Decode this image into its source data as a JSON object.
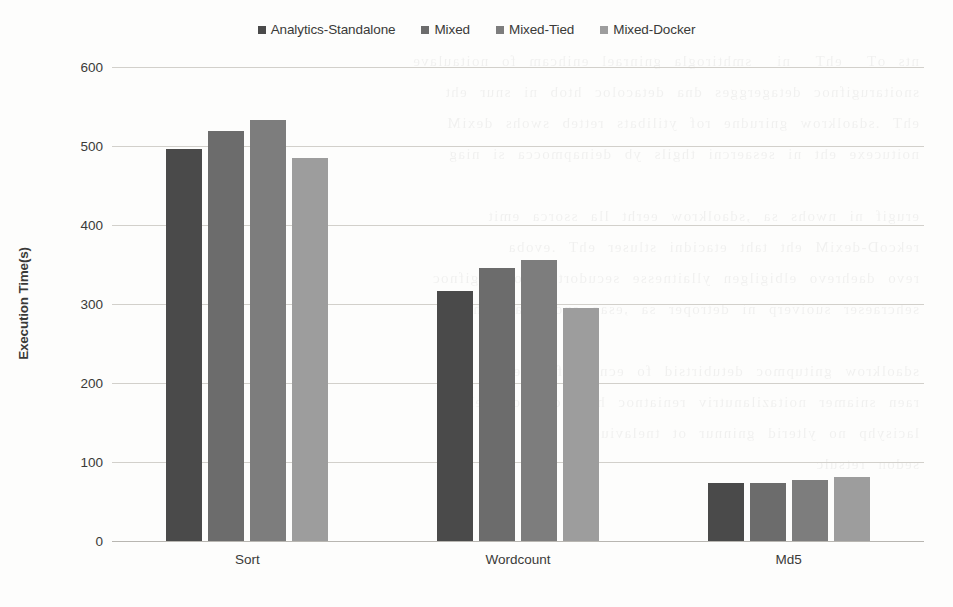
{
  "chart_data": {
    "type": "bar",
    "title": "",
    "xlabel": "",
    "ylabel": "Execution Time(s)",
    "ylim": [
      0,
      600
    ],
    "yticks": [
      0,
      100,
      200,
      300,
      400,
      500,
      600
    ],
    "grid": true,
    "legend_position": "top-center",
    "categories": [
      "Sort",
      "Wordcount",
      "Md5"
    ],
    "series": [
      {
        "name": "Analytics-Standalone",
        "color": "#4a4a4a",
        "values": [
          496,
          316,
          73
        ]
      },
      {
        "name": "Mixed",
        "color": "#6c6c6c",
        "values": [
          519,
          345,
          74
        ]
      },
      {
        "name": "Mixed-Tied",
        "color": "#7d7d7d",
        "values": [
          533,
          356,
          77
        ]
      },
      {
        "name": "Mixed-Docker",
        "color": "#9d9d9d",
        "values": [
          485,
          295,
          81
        ]
      }
    ]
  },
  "axis": {
    "y_title": "Execution Time(s)",
    "y_tick_0": "0",
    "y_tick_1": "100",
    "y_tick_2": "200",
    "y_tick_3": "300",
    "y_tick_4": "400",
    "y_tick_5": "500",
    "y_tick_6": "600"
  },
  "legend": {
    "items": [
      {
        "label": "Analytics-Standalone",
        "color": "#4a4a4a"
      },
      {
        "label": "Mixed",
        "color": "#6c6c6c"
      },
      {
        "label": "Mixed-Tied",
        "color": "#7d7d7d"
      },
      {
        "label": "Mixed-Docker",
        "color": "#9d9d9d"
      }
    ]
  },
  "scan_artifact": {
    "bleed_text": "nts oT  ehT  ni  smhtirogla gninrael enihcam fo noitaulave\nsnoitarugifnoc detagergges dna detacoloc htob ni snur eht\nehT .sdaolkrow gnirudne rof ytilibats retteb swohs dexiM\nnoitucexe eht ni sesaercni thgils yb deinapmocca si niag\n\nerugif ni nwohs sa ,sdaolkrow eerht lla ssorca emit\nrekcoD-dexiM eht taht etacidni stluser ehT .evoba\nrevo daehrevo elbigilgen yllaitnesse secudortni noitarugifnoc\nsehcraeser suoiverp ni detroper sa ,esac enoladnats eht\n\nsdaolkrow gnitupmoc detubirtsid fo ecnamrofrep ehT\nraen sniamer noitazilanutriv reniatnoc htiw delpuoc nehw\nlacisyhp no ylterid gninnur ot tnelaviuqe\nsedon retsulc"
  }
}
